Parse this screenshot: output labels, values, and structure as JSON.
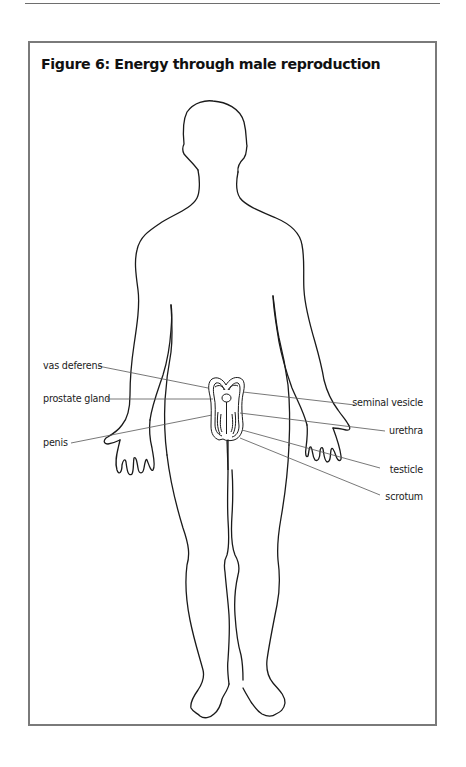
{
  "figure": {
    "title": "Figure 6: Energy through male reproduction",
    "labels": {
      "left": [
        {
          "id": "vas-deferens",
          "text": "vas deferens",
          "x": 43,
          "y": 360,
          "line": [
            98,
            366,
            208,
            388
          ]
        },
        {
          "id": "prostate-gland",
          "text": "prostate gland",
          "x": 43,
          "y": 393,
          "line": [
            107,
            399,
            213,
            399
          ]
        },
        {
          "id": "penis",
          "text": "penis",
          "x": 43,
          "y": 437,
          "line": [
            71,
            443,
            212,
            415
          ]
        }
      ],
      "right": [
        {
          "id": "seminal-vesicle",
          "text": "seminal vesicle",
          "right": 43,
          "y": 397,
          "line": [
            243,
            392,
            355,
            405
          ]
        },
        {
          "id": "urethra",
          "text": "urethra",
          "right": 43,
          "y": 425,
          "line": [
            240,
            413,
            385,
            431
          ]
        },
        {
          "id": "testicle",
          "text": "testicle",
          "right": 43,
          "y": 464,
          "line": [
            242,
            430,
            380,
            468
          ]
        },
        {
          "id": "scrotum",
          "text": "scrotum",
          "right": 43,
          "y": 491,
          "line": [
            240,
            438,
            380,
            495
          ]
        }
      ]
    },
    "colors": {
      "outline": "#1a1a1a",
      "leader": "#555555",
      "frame": "#7a7a7a"
    }
  }
}
